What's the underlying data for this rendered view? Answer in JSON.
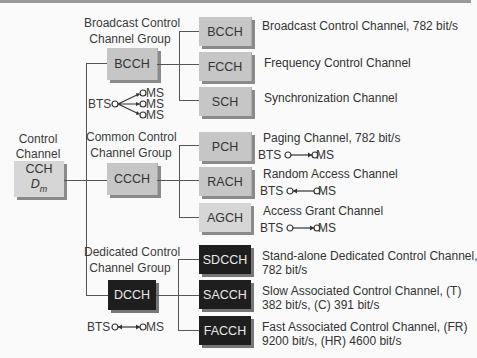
{
  "root": {
    "title_line1": "Control",
    "title_line2": "Channel",
    "box_label": "CCH",
    "box_sub": "Dm"
  },
  "groups": {
    "broadcast": {
      "caption_line1": "Broadcast Control",
      "caption_line2": "Channel Group",
      "box_label": "BCCH",
      "direction": {
        "from": "BTS",
        "to": [
          "MS",
          "MS",
          "MS"
        ]
      }
    },
    "common": {
      "caption_line1": "Common Control",
      "caption_line2": "Channel Group",
      "box_label": "CCCH"
    },
    "dedicated": {
      "caption_line1": "Dedicated Control",
      "caption_line2": "Channel Group",
      "box_label": "DCCH",
      "direction": {
        "from": "BTS",
        "to": "MS",
        "arrow": "bidirectional"
      }
    }
  },
  "channels": [
    {
      "label": "BCCH",
      "desc_line1": "Broadcast Control Channel, 782 bit/s",
      "desc_line2": "",
      "style": "light"
    },
    {
      "label": "FCCH",
      "desc_line1": "Frequency Control Channel",
      "desc_line2": "",
      "style": "light"
    },
    {
      "label": "SCH",
      "desc_line1": "Synchronization Channel",
      "desc_line2": "",
      "style": "light"
    },
    {
      "label": "PCH",
      "desc_line1": "Paging Channel, 782 bit/s",
      "dir": {
        "from": "BTS",
        "to": "MS",
        "arrow": "right"
      },
      "style": "light"
    },
    {
      "label": "RACH",
      "desc_line1": "Random Access Channel",
      "dir": {
        "from": "BTS",
        "to": "MS",
        "arrow": "left"
      },
      "style": "light"
    },
    {
      "label": "AGCH",
      "desc_line1": "Access Grant Channel",
      "dir": {
        "from": "BTS",
        "to": "MS",
        "arrow": "right"
      },
      "style": "lighter"
    },
    {
      "label": "SDCCH",
      "desc_line1": "Stand-alone Dedicated Control Channel,",
      "desc_line2": "782 bit/s",
      "style": "dark"
    },
    {
      "label": "SACCH",
      "desc_line1": "Slow Associated Control Channel, (T)",
      "desc_line2": "382 bit/s, (C) 391 bit/s",
      "style": "dark"
    },
    {
      "label": "FACCH",
      "desc_line1": "Fast Associated Control Channel, (FR)",
      "desc_line2": "9200 bit/s, (HR) 4600 bit/s",
      "style": "dark"
    }
  ],
  "colors": {
    "light_box": "#c6c6c6",
    "dark_box": "#1e1e1e",
    "line": "#555555",
    "background": "#fafafa"
  }
}
